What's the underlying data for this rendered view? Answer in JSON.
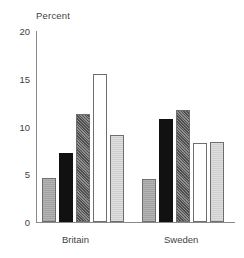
{
  "chart_data": {
    "type": "bar",
    "title": "",
    "subtitle": "",
    "xlabel": "",
    "ylabel": "Percent",
    "ylim": [
      0,
      20
    ],
    "yticks": [
      0,
      5,
      10,
      15,
      20
    ],
    "ytick_labels": [
      "0",
      "5",
      "10",
      "15",
      "20"
    ],
    "grid": false,
    "legend": "none",
    "categories": [
      "Britain",
      "Sweden"
    ],
    "series": [
      {
        "name": "series-1",
        "fill": "medium-gray-hatch",
        "values": [
          4.6,
          4.5
        ]
      },
      {
        "name": "series-2",
        "fill": "solid-black",
        "values": [
          7.2,
          10.8
        ]
      },
      {
        "name": "series-3",
        "fill": "dark-stipple",
        "values": [
          11.3,
          11.7
        ]
      },
      {
        "name": "series-4",
        "fill": "white",
        "values": [
          15.5,
          8.3
        ]
      },
      {
        "name": "series-5",
        "fill": "light-gray-hatch",
        "values": [
          9.1,
          8.4
        ]
      }
    ]
  },
  "axis": {
    "y_title": "Percent",
    "tick_20": "20",
    "tick_15": "15",
    "tick_10": "10",
    "tick_5": "5",
    "tick_0": "0"
  },
  "labels": {
    "britain": "Britain",
    "sweden": "Sweden"
  },
  "colors": {
    "axis": "#8a8a8a",
    "text": "#3f3f3f",
    "bar_outline": "#6e6e6e",
    "bar_black": "#111111",
    "bar_medium_gray": "#a8a8a8",
    "bar_dark_stipple": "#646464",
    "bar_white": "#ffffff",
    "bar_light_gray": "#d6d6d6"
  }
}
